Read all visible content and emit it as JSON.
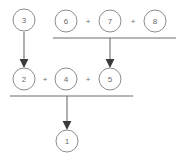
{
  "diagram": {
    "colors": {
      "node_stroke": "#8d8d8d",
      "node_fill": "#ffffff",
      "text": "#6b6b6b",
      "line": "#6e6e6e",
      "arrow": "#3a3a3a",
      "background": "#ffffff"
    },
    "nodes": [
      {
        "id": "node-3",
        "label": "3",
        "cx": 24,
        "cy": 20,
        "r": 11
      },
      {
        "id": "node-6",
        "label": "6",
        "cx": 66,
        "cy": 21,
        "r": 11
      },
      {
        "id": "node-7",
        "label": "7",
        "cx": 110,
        "cy": 21,
        "r": 11
      },
      {
        "id": "node-8",
        "label": "8",
        "cx": 155,
        "cy": 21,
        "r": 11
      },
      {
        "id": "node-2",
        "label": "2",
        "cx": 24,
        "cy": 79,
        "r": 11
      },
      {
        "id": "node-4",
        "label": "4",
        "cx": 66,
        "cy": 79,
        "r": 11
      },
      {
        "id": "node-5",
        "label": "5",
        "cx": 110,
        "cy": 79,
        "r": 11
      },
      {
        "id": "node-1",
        "label": "1",
        "cx": 67,
        "cy": 141,
        "r": 11
      }
    ],
    "operators": [
      {
        "id": "plus-top-left",
        "label": "+",
        "x": 88,
        "y": 21
      },
      {
        "id": "plus-top-right",
        "label": "+",
        "x": 133,
        "y": 21
      },
      {
        "id": "plus-mid-left",
        "label": "+",
        "x": 45,
        "y": 79
      },
      {
        "id": "plus-mid-right",
        "label": "+",
        "x": 88,
        "y": 79
      }
    ],
    "sum_bars": [
      {
        "id": "sum-bar-top",
        "x1": 53,
        "x2": 176,
        "y": 38
      },
      {
        "id": "sum-bar-bottom",
        "x1": 10,
        "x2": 133,
        "y": 96
      }
    ],
    "arrows": [
      {
        "id": "arrow-3-to-2",
        "x": 24,
        "y1": 32,
        "y2": 66
      },
      {
        "id": "arrow-topsum-to-5",
        "x": 110,
        "y1": 38,
        "y2": 66
      },
      {
        "id": "arrow-botsum-to-1",
        "x": 67,
        "y1": 96,
        "y2": 128
      }
    ]
  }
}
